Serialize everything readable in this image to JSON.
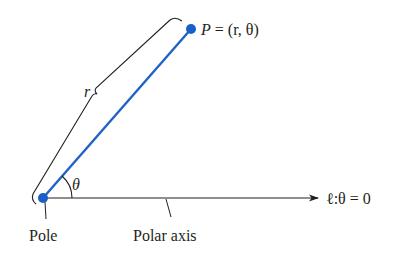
{
  "diagram": {
    "type": "polar-coordinate-system",
    "colors": {
      "ray": "#1f63c4",
      "point": "#1a5fc8",
      "ink": "#231f20",
      "background": "#ffffff"
    },
    "labels": {
      "point": "P = (r, θ)",
      "point_name": "P",
      "point_rest": " = (r, θ)",
      "radius": "r",
      "angle": "θ",
      "axis_equation": "ℓ:θ = 0",
      "pole": "Pole",
      "polar_axis": "Polar axis"
    },
    "nodes": [
      {
        "id": "pole",
        "label": "Pole",
        "x": 43,
        "y": 198
      },
      {
        "id": "P",
        "label": "P = (r, θ)",
        "x": 191,
        "y": 29
      }
    ],
    "edges": [
      {
        "from": "pole",
        "to": "P",
        "label": "r",
        "style": "blue line"
      },
      {
        "from": "pole",
        "to": "axis-end",
        "label": "ℓ:θ = 0",
        "style": "black arrow"
      }
    ]
  }
}
